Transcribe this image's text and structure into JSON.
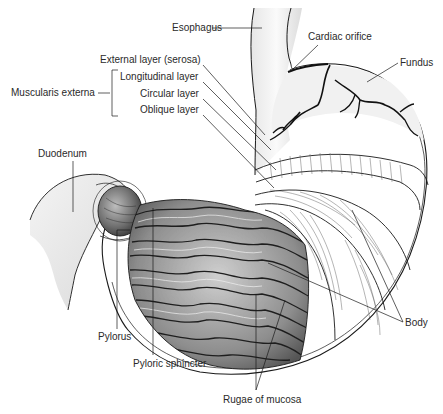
{
  "figure": {
    "labels": {
      "esophagus": "Esophagus",
      "cardiac_orifice": "Cardiac orifice",
      "fundus": "Fundus",
      "external_layer": "External layer (serosa)",
      "longitudinal_layer": "Longitudinal layer",
      "circular_layer": "Circular layer",
      "oblique_layer": "Oblique layer",
      "muscularis_externa": "Muscularis externa",
      "duodenum": "Duodenum",
      "pylorus": "Pylorus",
      "pyloric_sphincter": "Pyloric sphincter",
      "rugae_of_mucosa": "Rugae of mucosa",
      "body": "Body"
    },
    "colors": {
      "ink": "#1a1a1a",
      "label_text": "#2a2a2a",
      "rugae_shade": "#8a8a8a",
      "stipple": "#b5b5b5",
      "background": "#ffffff"
    }
  }
}
